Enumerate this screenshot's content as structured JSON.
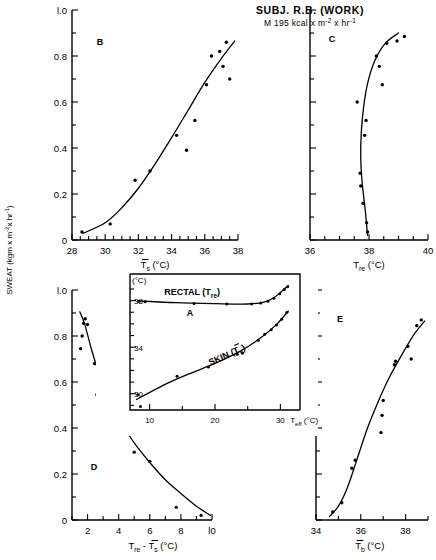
{
  "figure": {
    "title": "SUBJ. R.B. (WORK)",
    "subtitle_parts": {
      "lead": "M  195  kcal x m",
      "exp1": "-2",
      "mid": " x hr",
      "exp2": "-1"
    },
    "sweat_axis_label_parts": {
      "main": "SWEAT  (kgm x m",
      "exp1": "-2",
      "mid": "x hr",
      "exp2": "-1",
      "tail": ")"
    }
  },
  "chart_data": [
    {
      "id": "B",
      "type": "scatter",
      "panel_letter": "B",
      "title": "",
      "xlabel": "Ts  (°C)",
      "xlabel_parts": {
        "sym": "T",
        "sub": "s",
        "unit": "(°C)"
      },
      "ylabel": "SWEAT (kgm x m-2 x hr-1)",
      "xlim": [
        28,
        38
      ],
      "ylim": [
        0,
        1.0
      ],
      "xticks": [
        28,
        30,
        32,
        34,
        36,
        38
      ],
      "xtick_labels": [
        "28",
        "30",
        "32",
        "34",
        "36",
        "38"
      ],
      "xminor_step": 0.5,
      "yticks": [
        0,
        0.2,
        0.4,
        0.6,
        0.8,
        1.0
      ],
      "ytick_labels": [
        "0",
        "0.2",
        "0.4",
        "0.6",
        "0.8",
        "l.0"
      ],
      "yminor_step": 0.1,
      "points": [
        [
          28.6,
          0.035
        ],
        [
          30.3,
          0.07
        ],
        [
          31.8,
          0.26
        ],
        [
          32.7,
          0.3
        ],
        [
          34.3,
          0.455
        ],
        [
          34.9,
          0.39
        ],
        [
          35.4,
          0.52
        ],
        [
          36.1,
          0.675
        ],
        [
          36.4,
          0.8
        ],
        [
          36.9,
          0.82
        ],
        [
          37.1,
          0.755
        ],
        [
          37.3,
          0.86
        ],
        [
          37.5,
          0.7
        ]
      ],
      "curve": [
        [
          28.7,
          0.03
        ],
        [
          30.0,
          0.075
        ],
        [
          31.0,
          0.14
        ],
        [
          32.0,
          0.225
        ],
        [
          33.0,
          0.33
        ],
        [
          34.0,
          0.445
        ],
        [
          35.0,
          0.565
        ],
        [
          36.0,
          0.685
        ],
        [
          37.0,
          0.79
        ],
        [
          37.8,
          0.865
        ]
      ]
    },
    {
      "id": "C",
      "type": "scatter",
      "panel_letter": "C",
      "title": "",
      "xlabel": "Tre  (°C)",
      "xlabel_parts": {
        "sym": "T",
        "sub": "re",
        "unit": "(°C)"
      },
      "ylabel": "SWEAT",
      "xlim": [
        36,
        40
      ],
      "ylim": [
        0,
        1.0
      ],
      "xticks": [
        36,
        38,
        40
      ],
      "xtick_labels": [
        "36",
        "38",
        "40"
      ],
      "xminor_step": 0.5,
      "yticks": [
        0,
        0.2,
        0.4,
        0.6,
        0.8,
        1.0
      ],
      "ytick_labels": [
        "",
        "",
        "",
        "",
        "",
        ""
      ],
      "yminor_step": 0.1,
      "points": [
        [
          37.95,
          0.035
        ],
        [
          37.92,
          0.075
        ],
        [
          37.8,
          0.16
        ],
        [
          37.72,
          0.235
        ],
        [
          37.7,
          0.29
        ],
        [
          37.85,
          0.455
        ],
        [
          37.9,
          0.52
        ],
        [
          37.6,
          0.6
        ],
        [
          38.45,
          0.675
        ],
        [
          38.35,
          0.755
        ],
        [
          38.25,
          0.8
        ],
        [
          38.6,
          0.855
        ],
        [
          38.95,
          0.865
        ],
        [
          39.2,
          0.885
        ]
      ],
      "curve": [
        [
          37.95,
          0.02
        ],
        [
          37.88,
          0.12
        ],
        [
          37.76,
          0.26
        ],
        [
          37.72,
          0.36
        ],
        [
          37.74,
          0.47
        ],
        [
          37.82,
          0.58
        ],
        [
          37.95,
          0.68
        ],
        [
          38.2,
          0.78
        ],
        [
          38.55,
          0.855
        ],
        [
          39.0,
          0.9
        ]
      ]
    },
    {
      "id": "A",
      "type": "line",
      "panel_letter": "A",
      "title": "",
      "xlabel": "Teff  (°C)",
      "xlabel_parts": {
        "sym": "T",
        "sub": "eff",
        "unit": "(°C)"
      },
      "ylabel": "(°C)",
      "xlim": [
        7,
        33
      ],
      "ylim": [
        28.6,
        39.6
      ],
      "xticks": [
        10,
        20,
        30
      ],
      "xtick_labels": [
        "10",
        "20",
        "30"
      ],
      "xminor_step": 5,
      "yticks": [
        30,
        32,
        34,
        36,
        38
      ],
      "ytick_labels": [
        "30",
        "",
        "34",
        "",
        "38"
      ],
      "series": [
        {
          "name": "RECTAL (Tre)",
          "label_parts": {
            "main": "RECTAL (T",
            "sub": "re",
            "tail": ")"
          },
          "points": [
            [
              8.4,
              37.95
            ],
            [
              9.3,
              37.9
            ],
            [
              16.8,
              37.75
            ],
            [
              21.8,
              37.72
            ],
            [
              25.6,
              37.7
            ],
            [
              27.0,
              37.8
            ],
            [
              28.1,
              37.95
            ],
            [
              29.0,
              38.2
            ],
            [
              29.9,
              38.6
            ],
            [
              30.6,
              38.95
            ],
            [
              31.1,
              39.2
            ]
          ],
          "curve": [
            [
              8.2,
              37.98
            ],
            [
              14.0,
              37.82
            ],
            [
              20.0,
              37.74
            ],
            [
              25.0,
              37.71
            ],
            [
              27.5,
              37.88
            ],
            [
              29.0,
              38.25
            ],
            [
              30.3,
              38.85
            ],
            [
              31.2,
              39.3
            ]
          ]
        },
        {
          "name": "SKIN (Ts)",
          "label_parts": {
            "main": "SKIN (T",
            "sub": "s",
            "tail": ")"
          },
          "points": [
            [
              8.2,
              29.9
            ],
            [
              8.6,
              28.9
            ],
            [
              14.2,
              31.5
            ],
            [
              19.0,
              32.3
            ],
            [
              23.4,
              33.4
            ],
            [
              24.2,
              33.5
            ],
            [
              26.6,
              34.6
            ],
            [
              27.6,
              35.1
            ],
            [
              28.6,
              35.5
            ],
            [
              29.4,
              35.9
            ],
            [
              30.2,
              36.4
            ],
            [
              31.0,
              37.0
            ]
          ],
          "curve": [
            [
              8.0,
              29.5
            ],
            [
              12.0,
              30.7
            ],
            [
              16.0,
              31.7
            ],
            [
              20.0,
              32.6
            ],
            [
              24.0,
              33.7
            ],
            [
              27.0,
              34.8
            ],
            [
              29.5,
              36.0
            ],
            [
              31.2,
              37.1
            ]
          ]
        }
      ]
    },
    {
      "id": "D",
      "type": "scatter",
      "panel_letter": "D",
      "title": "",
      "xlabel": "Tre - Ts  (°C)",
      "xlabel_parts": {
        "sym1": "T",
        "sub1": "re",
        "dash": "-",
        "sym2": "T",
        "sub2": "s",
        "unit": "(°C)"
      },
      "ylabel": "SWEAT",
      "xlim": [
        1,
        10
      ],
      "ylim": [
        0,
        1.0
      ],
      "xticks": [
        2,
        4,
        6,
        8,
        10
      ],
      "xtick_labels": [
        "2",
        "4",
        "6",
        "8",
        "l0"
      ],
      "xminor_step": 1,
      "yticks": [
        0,
        0.2,
        0.4,
        0.6,
        0.8,
        1.0
      ],
      "ytick_labels": [
        "0",
        "0.2",
        "0.4",
        "0.6",
        "0.8",
        "l.0"
      ],
      "yminor_step": 0.1,
      "points": [
        [
          1.55,
          0.745
        ],
        [
          1.65,
          0.8
        ],
        [
          1.75,
          0.855
        ],
        [
          1.85,
          0.875
        ],
        [
          2.0,
          0.85
        ],
        [
          2.45,
          0.68
        ],
        [
          2.6,
          0.545
        ],
        [
          2.8,
          0.61
        ],
        [
          4.5,
          0.49
        ],
        [
          5.0,
          0.295
        ],
        [
          6.0,
          0.255
        ],
        [
          7.7,
          0.055
        ],
        [
          9.3,
          0.02
        ]
      ],
      "curve": [
        [
          1.5,
          0.905
        ],
        [
          1.8,
          0.855
        ],
        [
          2.2,
          0.755
        ],
        [
          2.6,
          0.665
        ],
        [
          3.2,
          0.555
        ],
        [
          4.0,
          0.44
        ],
        [
          5.0,
          0.335
        ],
        [
          6.0,
          0.25
        ],
        [
          7.0,
          0.175
        ],
        [
          8.0,
          0.115
        ],
        [
          9.0,
          0.06
        ],
        [
          9.9,
          0.02
        ]
      ]
    },
    {
      "id": "E",
      "type": "scatter",
      "panel_letter": "E",
      "title": "",
      "xlabel": "Tb  (°C)",
      "xlabel_parts": {
        "sym": "T",
        "sub": "b",
        "unit": "(°C)"
      },
      "ylabel": "SWEAT",
      "xlim": [
        34,
        39
      ],
      "ylim": [
        0,
        1.0
      ],
      "xticks": [
        34,
        36,
        38
      ],
      "xtick_labels": [
        "34",
        "36",
        "38"
      ],
      "xminor_step": 1,
      "yticks": [
        0,
        0.2,
        0.4,
        0.6,
        0.8,
        1.0
      ],
      "ytick_labels": [
        "",
        "",
        "",
        "",
        "",
        ""
      ],
      "yminor_step": 0.1,
      "points": [
        [
          34.75,
          0.035
        ],
        [
          35.15,
          0.075
        ],
        [
          35.75,
          0.26
        ],
        [
          35.6,
          0.225
        ],
        [
          36.9,
          0.38
        ],
        [
          36.95,
          0.455
        ],
        [
          37.0,
          0.52
        ],
        [
          37.5,
          0.675
        ],
        [
          37.55,
          0.69
        ],
        [
          38.1,
          0.755
        ],
        [
          38.25,
          0.7
        ],
        [
          38.5,
          0.845
        ],
        [
          38.7,
          0.87
        ]
      ],
      "curve": [
        [
          34.6,
          0.015
        ],
        [
          35.0,
          0.06
        ],
        [
          35.4,
          0.14
        ],
        [
          35.8,
          0.255
        ],
        [
          36.3,
          0.4
        ],
        [
          36.8,
          0.52
        ],
        [
          37.3,
          0.625
        ],
        [
          37.9,
          0.73
        ],
        [
          38.4,
          0.81
        ],
        [
          38.85,
          0.865
        ]
      ]
    }
  ]
}
